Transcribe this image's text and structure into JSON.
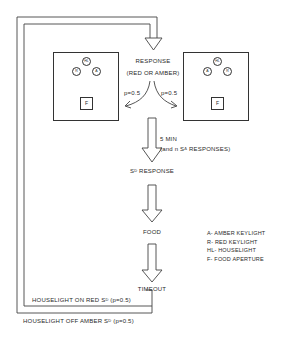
{
  "diagram": {
    "top": {
      "response_label": "RESPONSE",
      "response_sub": "(RED OR AMBER)",
      "p_left": "p=0.5",
      "p_right": "p=0.5"
    },
    "left_chamber": {
      "houselight": "HL",
      "key_left": "R",
      "key_right": "A",
      "food": "F"
    },
    "right_chamber": {
      "houselight": "HL",
      "key_left": "A",
      "key_right": "R",
      "food": "F"
    },
    "steps": {
      "condition_line1": "5 MIN",
      "condition_line2_pre": "(and ",
      "condition_n": "n",
      "condition_s": " S",
      "condition_sup": "Δ",
      "condition_post": " RESPONSES)",
      "sd_s": "S",
      "sd_sup": "D",
      "sd_rest": " RESPONSE",
      "food": "FOOD",
      "timeout": "TIMEOUT"
    },
    "loops": {
      "inner_pre": "HOUSELIGHT ON RED S",
      "inner_sup": "D",
      "inner_post": " (p=0.5)",
      "outer_pre": "HOUSELIGHT OFF AMBER S",
      "outer_sup": "D",
      "outer_post": " (p=0.5)"
    },
    "legend": [
      "A- AMBER KEYLIGHT",
      "R- RED KEYLIGHT",
      "HL- HOUSELIGHT",
      "F- FOOD APERTURE"
    ]
  }
}
